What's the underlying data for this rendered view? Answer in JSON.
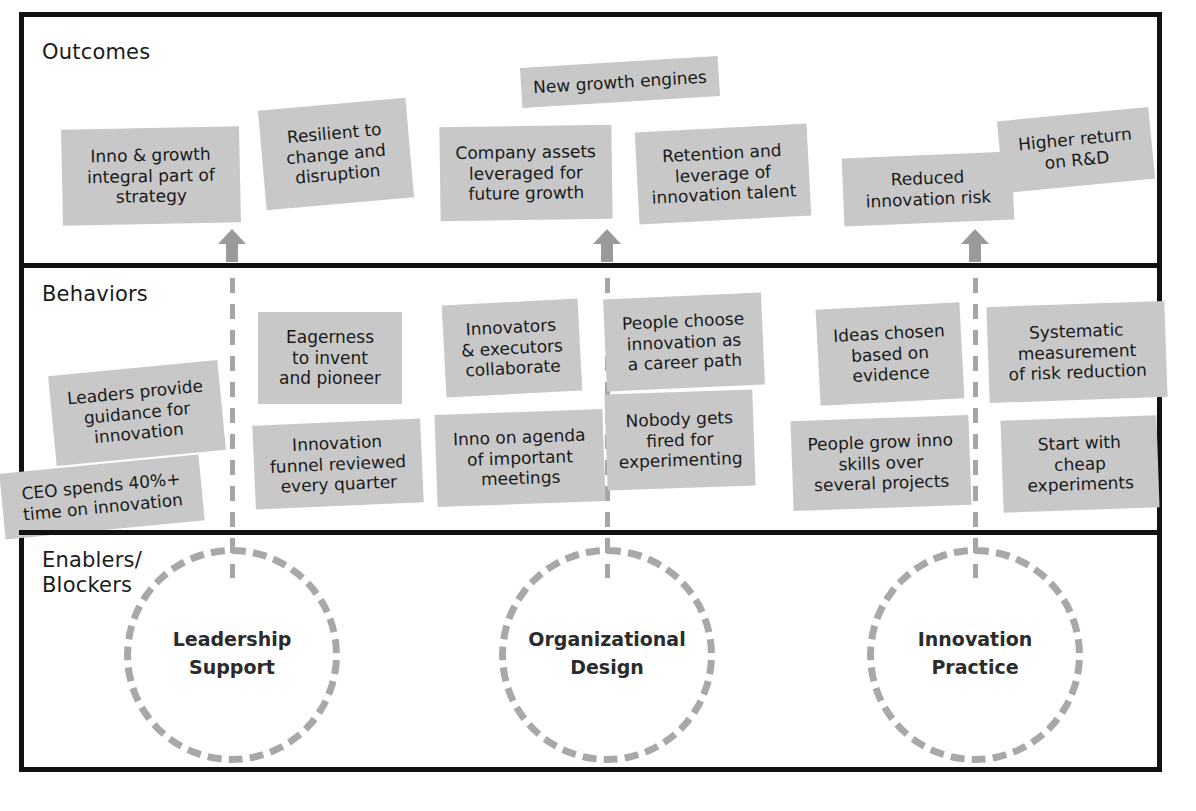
{
  "diagram": {
    "colors": {
      "card_fill": "#c8c8c8",
      "frame": "#111111",
      "dashed_gray": "#a8a8a8",
      "arrow_gray": "#9a9a9a",
      "text": "#1a1a1a"
    },
    "bands": [
      {
        "id": "outcomes",
        "label": "Outcomes"
      },
      {
        "id": "behaviors",
        "label": "Behaviors"
      },
      {
        "id": "enablers",
        "label": "Enablers/\nBlockers"
      }
    ],
    "outcomes_cards": [
      {
        "text": "Inno & growth\nintegral part of\nstrategy",
        "x": 62,
        "y": 128,
        "w": 178,
        "h": 96,
        "rot": -1.2
      },
      {
        "text": "Resilient to\nchange and\ndisruption",
        "x": 262,
        "y": 104,
        "w": 148,
        "h": 100,
        "rot": -5.0
      },
      {
        "text": "Company assets\nleveraged for\nfuture growth",
        "x": 440,
        "y": 126,
        "w": 172,
        "h": 94,
        "rot": -0.8
      },
      {
        "text": "New growth engines",
        "x": 521,
        "y": 62,
        "w": 198,
        "h": 40,
        "rot": -3.5
      },
      {
        "text": "Retention and\nleverage of\ninnovation talent",
        "x": 637,
        "y": 128,
        "w": 172,
        "h": 92,
        "rot": -3.0
      },
      {
        "text": "Reduced\ninnovation risk",
        "x": 843,
        "y": 155,
        "w": 170,
        "h": 68,
        "rot": -2.4
      },
      {
        "text": "Higher return\non R&D",
        "x": 1000,
        "y": 114,
        "w": 152,
        "h": 72,
        "rot": -5.5
      }
    ],
    "behaviors_cards": [
      {
        "text": "Leaders provide\nguidance for\ninnovation",
        "x": 52,
        "y": 368,
        "w": 170,
        "h": 90,
        "rot": -5.5
      },
      {
        "text": "CEO spends 40%+\ntime on innovation",
        "x": 2,
        "y": 464,
        "w": 200,
        "h": 66,
        "rot": -5.5
      },
      {
        "text": "Eagerness\nto invent\nand pioneer",
        "x": 258,
        "y": 312,
        "w": 144,
        "h": 92,
        "rot": 0.0
      },
      {
        "text": "Innovation\nfunnel reviewed\nevery quarter",
        "x": 254,
        "y": 422,
        "w": 168,
        "h": 84,
        "rot": -2.5
      },
      {
        "text": "Innovators\n& executors\ncollaborate",
        "x": 444,
        "y": 302,
        "w": 136,
        "h": 92,
        "rot": -3.0
      },
      {
        "text": "Inno on agenda\nof important\nmeetings",
        "x": 436,
        "y": 412,
        "w": 168,
        "h": 92,
        "rot": -2.0
      },
      {
        "text": "People choose\ninnovation as\na career path",
        "x": 605,
        "y": 296,
        "w": 158,
        "h": 92,
        "rot": -2.5
      },
      {
        "text": "Nobody gets\nfired for\nexperimenting",
        "x": 606,
        "y": 392,
        "w": 148,
        "h": 96,
        "rot": -2.0
      },
      {
        "text": "Ideas chosen\nbased on\nevidence",
        "x": 818,
        "y": 306,
        "w": 144,
        "h": 96,
        "rot": -3.0
      },
      {
        "text": "People grow inno\nskills over\nseveral projects",
        "x": 792,
        "y": 418,
        "w": 178,
        "h": 90,
        "rot": -2.0
      },
      {
        "text": "Systematic\nmeasurement\nof risk reduction",
        "x": 988,
        "y": 304,
        "w": 178,
        "h": 96,
        "rot": -2.0
      },
      {
        "text": "Start with\ncheap\nexperiments",
        "x": 1002,
        "y": 418,
        "w": 156,
        "h": 92,
        "rot": -2.0
      }
    ],
    "enablers_circles": [
      {
        "label": "Leadership\nSupport",
        "cx": 232,
        "cy": 655,
        "r": 108
      },
      {
        "label": "Organizational\nDesign",
        "cx": 607,
        "cy": 655,
        "r": 108
      },
      {
        "label": "Innovation\nPractice",
        "cx": 975,
        "cy": 655,
        "r": 108
      }
    ],
    "connectors": [
      {
        "x": 232,
        "top": 280,
        "height": 290,
        "arrow_y": 230
      },
      {
        "x": 607,
        "top": 280,
        "height": 290,
        "arrow_y": 230
      },
      {
        "x": 975,
        "top": 280,
        "height": 290,
        "arrow_y": 230
      }
    ]
  }
}
